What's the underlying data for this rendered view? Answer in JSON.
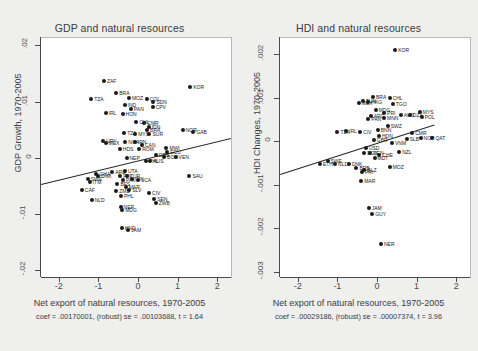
{
  "figure": {
    "background": "#efefee",
    "point_color": "#1a1a1a",
    "fitline_color": "#262626"
  },
  "panels": [
    {
      "id": "gdp",
      "title": "GDP and natural resources",
      "xlabel": "Net export of natural resources, 1970-2005",
      "ylabel": "GDP Growth, 1970-2005",
      "note": "coef = .00170001, (robust) se = .00103688, t = 1.64",
      "xticks": [
        "-2",
        "-1",
        "0",
        "1",
        "2"
      ],
      "yticks": [
        ".02",
        ".01",
        "0",
        "-.01",
        "-.02"
      ]
    },
    {
      "id": "hdi",
      "title": "HDI and natural resources",
      "xlabel": "Net export of natural resources, 1970-2005",
      "ylabel": "HDI Changes, 1970-2005",
      "note": "coef = .00029186, (robust) se = .00007374, t = 3.96",
      "xticks": [
        "-2",
        "-1",
        "0",
        "1",
        "2"
      ],
      "yticks": [
        ".002",
        ".001",
        "0",
        "-.001",
        "-.002",
        "-.003"
      ]
    }
  ],
  "chart_data": [
    {
      "type": "scatter",
      "panel": "gdp",
      "title": "GDP and natural resources",
      "xlabel": "Net export of natural resources, 1970-2005",
      "ylabel": "GDP Growth, 1970-2005",
      "xlim": [
        -2.45,
        2.35
      ],
      "ylim": [
        -0.021,
        0.0215
      ],
      "grid": false,
      "legend": false,
      "regression": {
        "coef": 0.00170001,
        "se_robust": 0.00103688,
        "t": 1.64,
        "note": "coef = .00170001, (robust) se = .00103688, t = 1.64",
        "x_from": -2.45,
        "y_from": -0.0045,
        "x_to": 2.35,
        "y_to": 0.0037
      },
      "points": [
        {
          "label": "ZAF",
          "x": -0.86,
          "y": 0.0138
        },
        {
          "label": "KOR",
          "x": 1.32,
          "y": 0.0128
        },
        {
          "label": "BRA",
          "x": -0.55,
          "y": 0.0118
        },
        {
          "label": "MOZ",
          "x": -0.23,
          "y": 0.0109
        },
        {
          "label": "TZA",
          "x": -1.18,
          "y": 0.0107
        },
        {
          "label": "COL",
          "x": 0.22,
          "y": 0.0107
        },
        {
          "label": "SDN",
          "x": 0.39,
          "y": 0.0101
        },
        {
          "label": "IND",
          "x": -0.34,
          "y": 0.0096
        },
        {
          "label": "CPV",
          "x": 0.37,
          "y": 0.0092
        },
        {
          "label": "PAN",
          "x": -0.18,
          "y": 0.0089
        },
        {
          "label": "IRL",
          "x": -0.82,
          "y": 0.0082
        },
        {
          "label": "HON",
          "x": -0.39,
          "y": 0.008
        },
        {
          "label": "CHL",
          "x": -0.04,
          "y": 0.0066
        },
        {
          "label": "CMR",
          "x": 0.16,
          "y": 0.0064
        },
        {
          "label": "IDN",
          "x": 0.27,
          "y": 0.0057
        },
        {
          "label": "NOR",
          "x": 1.13,
          "y": 0.0052
        },
        {
          "label": "GAB",
          "x": 1.4,
          "y": 0.0047
        },
        {
          "label": "BRA2",
          "x": 0.23,
          "y": 0.0051
        },
        {
          "label": "MYS",
          "x": -0.07,
          "y": 0.0045
        },
        {
          "label": "SUR",
          "x": 0.29,
          "y": 0.0044
        },
        {
          "label": "TZA2",
          "x": -0.35,
          "y": 0.0046
        },
        {
          "label": "URY",
          "x": -0.88,
          "y": 0.0031
        },
        {
          "label": "MEX",
          "x": -0.82,
          "y": 0.0028
        },
        {
          "label": "NGA",
          "x": -0.32,
          "y": 0.003
        },
        {
          "label": "IRN",
          "x": -0.08,
          "y": 0.003
        },
        {
          "label": "CAN",
          "x": 0.1,
          "y": 0.0024
        },
        {
          "label": "ROM",
          "x": 0.03,
          "y": 0.0017
        },
        {
          "label": "HDS",
          "x": -0.46,
          "y": 0.0017
        },
        {
          "label": "MWI",
          "x": 0.72,
          "y": 0.0019
        },
        {
          "label": "ECU",
          "x": 0.74,
          "y": 0.0013
        },
        {
          "label": "DRB",
          "x": 0.45,
          "y": 0.0007
        },
        {
          "label": "BOL",
          "x": 0.66,
          "y": 0.0004
        },
        {
          "label": "VEN",
          "x": 0.95,
          "y": 0.0004
        },
        {
          "label": "NEP",
          "x": -0.29,
          "y": 0.0001
        },
        {
          "label": "PHL",
          "x": 0.2,
          "y": -0.0003
        },
        {
          "label": "AUS",
          "x": 0.31,
          "y": -0.0003
        },
        {
          "label": "GHA",
          "x": -1.05,
          "y": -0.0026
        },
        {
          "label": "ARE",
          "x": -0.65,
          "y": -0.0023
        },
        {
          "label": "UTA",
          "x": -0.33,
          "y": -0.0021
        },
        {
          "label": "DNK",
          "x": -1.01,
          "y": -0.0031
        },
        {
          "label": "FIN",
          "x": -0.45,
          "y": -0.0031
        },
        {
          "label": "TUR",
          "x": -0.28,
          "y": -0.003
        },
        {
          "label": "PAK",
          "x": -0.38,
          "y": -0.0037
        },
        {
          "label": "GIN",
          "x": -0.15,
          "y": -0.0035
        },
        {
          "label": "LCA",
          "x": 0.01,
          "y": -0.0038
        },
        {
          "label": "SWE",
          "x": -1.27,
          "y": -0.0036
        },
        {
          "label": "ITM",
          "x": -1.22,
          "y": -0.0041
        },
        {
          "label": "BFS",
          "x": -0.52,
          "y": -0.0045
        },
        {
          "label": "MAR",
          "x": -0.31,
          "y": -0.005
        },
        {
          "label": "SLV",
          "x": -0.22,
          "y": -0.0056
        },
        {
          "label": "ZMB",
          "x": -0.55,
          "y": -0.0057
        },
        {
          "label": "SAU",
          "x": 1.3,
          "y": -0.0031
        },
        {
          "label": "CAF",
          "x": -1.42,
          "y": -0.0056
        },
        {
          "label": "CIV",
          "x": 0.28,
          "y": -0.006
        },
        {
          "label": "PHL2",
          "x": -0.43,
          "y": -0.0066
        },
        {
          "label": "SEN",
          "x": 0.41,
          "y": -0.0071
        },
        {
          "label": "ZWB",
          "x": 0.45,
          "y": -0.0078
        },
        {
          "label": "NLD",
          "x": -1.17,
          "y": -0.0073
        },
        {
          "label": "NER",
          "x": -0.44,
          "y": -0.0086
        },
        {
          "label": "MDG",
          "x": -0.4,
          "y": -0.009
        },
        {
          "label": "HND",
          "x": -0.41,
          "y": -0.0123
        },
        {
          "label": "JAM",
          "x": -0.25,
          "y": -0.0127
        }
      ]
    },
    {
      "type": "scatter",
      "panel": "hdi",
      "title": "HDI and natural resources",
      "xlabel": "Net export of natural resources, 1970-2005",
      "ylabel": "HDI Changes, 1970-2005",
      "xlim": [
        -2.45,
        2.35
      ],
      "ylim": [
        -0.0031,
        0.0024
      ],
      "grid": false,
      "legend": false,
      "regression": {
        "coef": 0.00029186,
        "se_robust": 7.374e-05,
        "t": 3.96,
        "note": "coef = .00029186, (robust) se = .00007374, t = 3.96",
        "x_from": -2.45,
        "y_from": -0.00072,
        "x_to": 1.45,
        "y_to": 0.00042
      },
      "points": [
        {
          "label": "KOR",
          "x": 0.46,
          "y": 0.00213
        },
        {
          "label": "BRA",
          "x": -0.1,
          "y": 0.00104
        },
        {
          "label": "CHL",
          "x": 0.32,
          "y": 0.00103
        },
        {
          "label": "TUN",
          "x": -0.36,
          "y": 0.00095
        },
        {
          "label": "HKG",
          "x": -0.22,
          "y": 0.00093
        },
        {
          "label": "MEX",
          "x": -0.46,
          "y": 0.00091
        },
        {
          "label": "TGO",
          "x": 0.4,
          "y": 0.00089
        },
        {
          "label": "MDG",
          "x": -0.03,
          "y": 0.00074
        },
        {
          "label": "PRI",
          "x": 0.18,
          "y": 0.00068
        },
        {
          "label": "MYS",
          "x": 1.08,
          "y": 0.00069
        },
        {
          "label": "AUS",
          "x": 0.6,
          "y": 0.00063
        },
        {
          "label": "DZA",
          "x": 0.83,
          "y": 0.00062
        },
        {
          "label": "POL",
          "x": 1.13,
          "y": 0.00059
        },
        {
          "label": "ARG",
          "x": -0.16,
          "y": 0.00061
        },
        {
          "label": "MNN",
          "x": 0.18,
          "y": 0.00056
        },
        {
          "label": "PAN",
          "x": -0.22,
          "y": 0.00054
        },
        {
          "label": "SWZ",
          "x": 0.27,
          "y": 0.00038
        },
        {
          "label": "TZA",
          "x": -1.0,
          "y": 0.00024
        },
        {
          "label": "IRL",
          "x": -0.78,
          "y": 0.00026
        },
        {
          "label": "BNN",
          "x": 0.02,
          "y": 0.00029
        },
        {
          "label": "CIV",
          "x": -0.42,
          "y": 0.00023
        },
        {
          "label": "CMR",
          "x": 0.89,
          "y": 0.00021
        },
        {
          "label": "HDN",
          "x": 0.05,
          "y": 0.00015
        },
        {
          "label": "NOR",
          "x": 1.1,
          "y": 0.0001
        },
        {
          "label": "QAT",
          "x": 1.4,
          "y": 9e-05
        },
        {
          "label": "SLB",
          "x": 0.75,
          "y": 8e-05
        },
        {
          "label": "GBR",
          "x": -0.08,
          "y": 6e-05
        },
        {
          "label": "VNM",
          "x": 0.38,
          "y": -2e-05
        },
        {
          "label": "USD",
          "x": -0.28,
          "y": -0.00013
        },
        {
          "label": "NZL",
          "x": 0.56,
          "y": -0.00022
        },
        {
          "label": "EGY",
          "x": -0.32,
          "y": -0.00025
        },
        {
          "label": "SEN",
          "x": -0.17,
          "y": -0.00024
        },
        {
          "label": "CHE",
          "x": 0.06,
          "y": -0.00029
        },
        {
          "label": "MDT",
          "x": -0.06,
          "y": -0.00037
        },
        {
          "label": "SWE",
          "x": -1.25,
          "y": -0.00044
        },
        {
          "label": "ETH",
          "x": -1.44,
          "y": -0.0005
        },
        {
          "label": "NLD",
          "x": -1.06,
          "y": -0.0005
        },
        {
          "label": "DNK",
          "x": -0.71,
          "y": -0.00051
        },
        {
          "label": "BRB",
          "x": -0.52,
          "y": -0.00059
        },
        {
          "label": "BLZ",
          "x": -0.32,
          "y": -0.00063
        },
        {
          "label": "PRI2",
          "x": -0.38,
          "y": -0.00068
        },
        {
          "label": "MOZ",
          "x": 0.32,
          "y": -0.00058
        },
        {
          "label": "MAR",
          "x": -0.4,
          "y": -0.00089
        },
        {
          "label": "JAM",
          "x": -0.21,
          "y": -0.00152
        },
        {
          "label": "GUY",
          "x": -0.12,
          "y": -0.00164
        },
        {
          "label": "NER",
          "x": 0.1,
          "y": -0.00235
        }
      ]
    }
  ]
}
